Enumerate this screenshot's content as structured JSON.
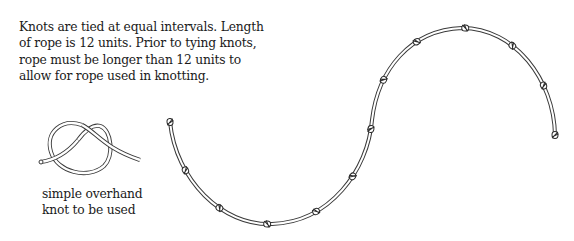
{
  "caption": {
    "lines": [
      "Knots are tied at equal intervals. Length",
      "of rope is 12 units. Prior to tying knots,",
      "rope must be longer than 12 units to",
      "allow for rope used in knotting."
    ]
  },
  "knot_illustration": {
    "label_lines": [
      "simple overhand",
      "knot to be used"
    ]
  },
  "rope": {
    "length_units": 12,
    "knot_count": 12,
    "shape": "S-curve",
    "stroke_color": "#3a3a3a"
  }
}
